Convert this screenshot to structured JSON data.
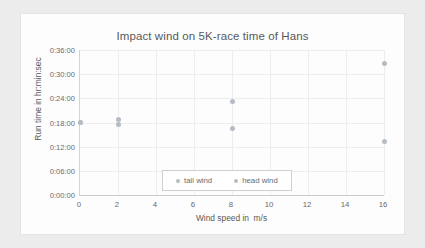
{
  "chart_data": {
    "type": "scatter",
    "title": "Impact wind on 5K-race time of Hans",
    "xlabel": "Wind speed in  m/s",
    "ylabel": "Run time in hr:min:sec",
    "xlim": [
      0,
      16
    ],
    "ylim": [
      0,
      36
    ],
    "x_ticks": [
      "0",
      "2",
      "4",
      "6",
      "8",
      "10",
      "12",
      "14",
      "16"
    ],
    "x_tick_values": [
      0,
      2,
      4,
      6,
      8,
      10,
      12,
      14,
      16
    ],
    "y_ticks": [
      "0:00:00",
      "0:06:00",
      "0:12:00",
      "0:18:00",
      "0:24:00",
      "0:30:00",
      "0:36:00"
    ],
    "y_tick_values": [
      0,
      6,
      12,
      18,
      24,
      30,
      36
    ],
    "y_unit": "minutes",
    "grid": true,
    "legend_position": "inside lower-right",
    "series": [
      {
        "name": "tail wind",
        "color": "#b6bcc4",
        "points": [
          {
            "x": 0,
            "y": 18.0,
            "label": "0:18:00"
          },
          {
            "x": 2,
            "y": 17.5,
            "label": "0:17:30"
          },
          {
            "x": 8,
            "y": 16.5,
            "label": "0:16:30"
          },
          {
            "x": 16,
            "y": 13.3,
            "label": "0:13:20"
          }
        ]
      },
      {
        "name": "head wind",
        "color": "#b6bcc4",
        "points": [
          {
            "x": 0,
            "y": 18.0,
            "label": "0:18:00"
          },
          {
            "x": 2,
            "y": 18.7,
            "label": "0:18:40"
          },
          {
            "x": 8,
            "y": 23.3,
            "label": "0:23:20"
          },
          {
            "x": 16,
            "y": 32.7,
            "label": "0:32:40"
          }
        ]
      }
    ]
  }
}
